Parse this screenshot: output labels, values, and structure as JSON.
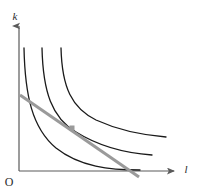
{
  "figure": {
    "kind": "isoquant-isocost-diagram",
    "background_color": "#ffffff",
    "width": 198,
    "height": 196
  },
  "axes": {
    "y_axis_label": "k",
    "x_axis_label": "l",
    "origin_label": "O",
    "axis_color": "#5a5a5a",
    "axis_line_width": 1.2,
    "y_axis_x": 19,
    "y_axis_top": 24,
    "y_axis_bottom": 171,
    "x_axis_y": 171,
    "x_axis_left": 19,
    "x_axis_right": 176,
    "y_label_position": {
      "x": 15,
      "y": 20
    },
    "x_label_position": {
      "x": 186,
      "y": 173
    },
    "origin_label_position": {
      "x": 5,
      "y": 186
    }
  },
  "curves": {
    "color": "#1a1a1a",
    "line_width": 1.3,
    "count": 3,
    "items": [
      {
        "name": "isoquant-inner",
        "label": "lowest output isoquant",
        "path": "M 24 48 C 25 95, 32 128, 56 148 C 80 167, 110 170, 140 170"
      },
      {
        "name": "isoquant-middle",
        "label": "tangent output isoquant",
        "path": "M 42 48 C 43 92, 52 118, 76 132 C 100 147, 124 153, 152 155"
      },
      {
        "name": "isoquant-outer",
        "label": "highest output isoquant",
        "path": "M 61 48 C 62 88, 72 108, 96 120 C 120 131, 142 135, 166 137"
      }
    ]
  },
  "isocost_line": {
    "name": "isocost-line",
    "color": "#9a9a9a",
    "line_width": 3,
    "start": {
      "x": 20,
      "y": 95
    },
    "end": {
      "x": 139,
      "y": 177
    }
  },
  "tangency_point": {
    "name": "tangency-point",
    "color": "#9a9a9a",
    "x": 72,
    "y": 128,
    "size": 5
  },
  "chart_data": {
    "type": "line",
    "title": "",
    "xlabel": "l",
    "ylabel": "k",
    "legend": [],
    "grid": false,
    "annotations": [
      "O"
    ],
    "series": [
      {
        "name": "isoquant-inner",
        "x": [
          24,
          32,
          44,
          56,
          72,
          96,
          120,
          140
        ],
        "y": [
          48,
          110,
          136,
          148,
          160,
          167,
          169,
          170
        ]
      },
      {
        "name": "isoquant-middle",
        "x": [
          42,
          50,
          60,
          76,
          96,
          120,
          140,
          152
        ],
        "y": [
          48,
          100,
          118,
          132,
          141,
          149,
          153,
          155
        ]
      },
      {
        "name": "isoquant-outer",
        "x": [
          61,
          70,
          82,
          96,
          118,
          140,
          166
        ],
        "y": [
          48,
          94,
          110,
          120,
          129,
          134,
          137
        ]
      },
      {
        "name": "isocost-line",
        "x": [
          20,
          139
        ],
        "y": [
          95,
          177
        ]
      }
    ],
    "points": [
      {
        "name": "tangency-point",
        "x": 72,
        "y": 128
      }
    ]
  }
}
